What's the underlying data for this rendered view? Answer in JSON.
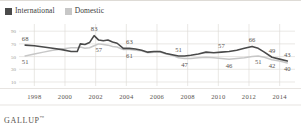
{
  "legend": {
    "entries": [
      {
        "label": "International",
        "color": "#4a4a4a",
        "key": "international"
      },
      {
        "label": "Domestic",
        "color": "#c7c7c7",
        "key": "domestic"
      }
    ]
  },
  "brand": {
    "name": "GALLUP",
    "mark": "™"
  },
  "chart_data": {
    "type": "line",
    "title": "",
    "xlabel": "",
    "ylabel": "",
    "xlim": [
      1997,
      2015
    ],
    "ylim": [
      10,
      95
    ],
    "grid": true,
    "legend_position": "top-left",
    "yticks": [
      90,
      70,
      50,
      30,
      10
    ],
    "ytick_labels": [
      "90",
      "70",
      "50",
      "30",
      "10"
    ],
    "xticks": [
      1998,
      2000,
      2002,
      2004,
      2006,
      2008,
      2010,
      2012,
      2014
    ],
    "xtick_labels": [
      "1998",
      "2000",
      "2002",
      "2004",
      "2006",
      "2008",
      "2010",
      "2012",
      "2014"
    ],
    "x": [
      1997.4,
      1998,
      1998.6,
      1999.2,
      1999.8,
      2000.4,
      2000.8,
      2001.0,
      2001.3,
      2001.6,
      2001.9,
      2002.2,
      2002.5,
      2002.8,
      2003.1,
      2003.4,
      2003.8,
      2004.2,
      2004.6,
      2005.0,
      2005.4,
      2005.8,
      2006.2,
      2006.6,
      2007.0,
      2007.4,
      2007.8,
      2008.2,
      2008.7,
      2009.2,
      2009.7,
      2010.2,
      2010.7,
      2011.2,
      2011.7,
      2012.2,
      2012.6,
      2013.0,
      2013.5,
      2014.0,
      2014.5
    ],
    "series": [
      {
        "name": "International",
        "key": "international",
        "color": "#4a4a4a",
        "values": [
          68,
          67,
          65,
          63,
          61,
          58,
          58,
          70,
          69,
          72,
          83,
          76,
          75,
          76,
          73,
          71,
          63,
          63,
          62,
          60,
          57,
          58,
          58,
          55,
          53,
          51,
          51,
          52,
          54,
          57,
          56,
          57,
          58,
          60,
          63,
          66,
          63,
          57,
          49,
          46,
          43
        ],
        "labels": [
          {
            "x": 1997.4,
            "value": 68,
            "text": "68",
            "position": "above"
          },
          {
            "x": 2001.9,
            "value": 83,
            "text": "83",
            "position": "above"
          },
          {
            "x": 2004.2,
            "value": 63,
            "text": "63",
            "position": "above"
          },
          {
            "x": 2007.4,
            "value": 51,
            "text": "51",
            "position": "above"
          },
          {
            "x": 2010.2,
            "value": 57,
            "text": "57",
            "position": "above"
          },
          {
            "x": 2012.2,
            "value": 66,
            "text": "66",
            "position": "above"
          },
          {
            "x": 2013.5,
            "value": 49,
            "text": "49",
            "position": "above"
          },
          {
            "x": 2014.5,
            "value": 43,
            "text": "43",
            "position": "above"
          }
        ]
      },
      {
        "name": "Domestic",
        "key": "domestic",
        "color": "#c7c7c7",
        "values": [
          51,
          54,
          57,
          60,
          62,
          64,
          64,
          65,
          63,
          64,
          67,
          70,
          69,
          68,
          66,
          65,
          61,
          61,
          60,
          59,
          56,
          57,
          57,
          54,
          52,
          48,
          47,
          47,
          48,
          49,
          48,
          47,
          46,
          47,
          48,
          50,
          51,
          49,
          45,
          43,
          40
        ],
        "labels": [
          {
            "x": 1997.4,
            "value": 51,
            "text": "51",
            "position": "below"
          },
          {
            "x": 2002.2,
            "value": 70,
            "text": "57",
            "position": "below"
          },
          {
            "x": 2004.2,
            "value": 61,
            "text": "61",
            "position": "below"
          },
          {
            "x": 2007.8,
            "value": 47,
            "text": "47",
            "position": "below"
          },
          {
            "x": 2010.7,
            "value": 46,
            "text": "46",
            "position": "below"
          },
          {
            "x": 2012.6,
            "value": 51,
            "text": "51",
            "position": "below"
          },
          {
            "x": 2013.5,
            "value": 45,
            "text": "42",
            "position": "below"
          },
          {
            "x": 2014.5,
            "value": 40,
            "text": "40",
            "position": "below"
          }
        ]
      }
    ]
  }
}
